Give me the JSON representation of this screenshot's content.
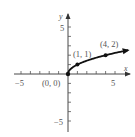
{
  "chart_data": {
    "type": "line",
    "title": "",
    "function": "y = sqrt(x)",
    "xlabel": "x",
    "ylabel": "y",
    "xlim": [
      -5.8,
      6.5
    ],
    "ylim": [
      -6.2,
      6.3
    ],
    "x_ticks": [
      -5,
      -4,
      -3,
      -2,
      -1,
      1,
      2,
      3,
      4,
      5
    ],
    "y_ticks": [
      -5,
      -4,
      -3,
      -2,
      -1,
      1,
      2,
      3,
      4,
      5
    ],
    "tick_labels": {
      "x": [
        {
          "value": -5,
          "label": "−5"
        },
        {
          "value": 5,
          "label": "5"
        }
      ],
      "y": [
        {
          "value": 5,
          "label": "5"
        },
        {
          "value": -5,
          "label": "−5"
        }
      ]
    },
    "grid": false,
    "legend": null,
    "series": [
      {
        "name": "sqrt(x)",
        "x": [
          0,
          0.25,
          1,
          2,
          3,
          4,
          5,
          6.4
        ],
        "y": [
          0,
          0.5,
          1,
          1.414,
          1.732,
          2,
          2.236,
          2.53
        ],
        "end_arrow": true
      }
    ],
    "points": [
      {
        "x": 0,
        "y": 0,
        "label": "(0, 0)"
      },
      {
        "x": 1,
        "y": 1,
        "label": "(1, 1)"
      },
      {
        "x": 4,
        "y": 2,
        "label": "(4, 2)"
      }
    ]
  }
}
